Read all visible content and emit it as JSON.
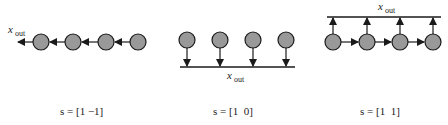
{
  "panels": [
    {
      "id": "left",
      "output_label": "x",
      "output_subscript": "out",
      "caption": "s = [1 −1]",
      "topology": "chain-left",
      "nodes": 4
    },
    {
      "id": "middle",
      "output_label": "x",
      "output_subscript": "out",
      "caption": "s = [1  0]",
      "topology": "parallel-down-to-bus",
      "nodes": 4
    },
    {
      "id": "right",
      "output_label": "x",
      "output_subscript": "out",
      "caption": "s = [1  1]",
      "topology": "chain-right-plus-up-to-bus",
      "nodes": 4
    }
  ],
  "colors": {
    "node_fill": "#999999",
    "stroke": "#1a1a1a"
  }
}
